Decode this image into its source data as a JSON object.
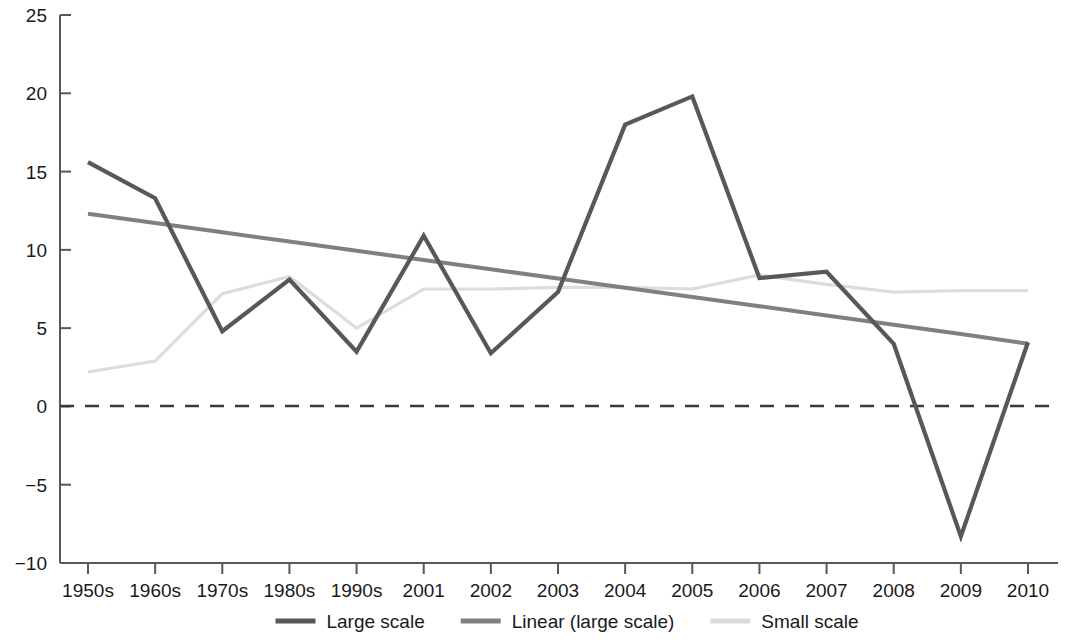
{
  "chart_data": {
    "type": "line",
    "title": "",
    "subtitle": "",
    "xlabel": "",
    "ylabel": "",
    "categories": [
      "1950s",
      "1960s",
      "1970s",
      "1980s",
      "1990s",
      "2001",
      "2002",
      "2003",
      "2004",
      "2005",
      "2006",
      "2007",
      "2008",
      "2009",
      "2010"
    ],
    "ylim": [
      -10,
      25
    ],
    "yticks": [
      25,
      20,
      15,
      10,
      5,
      0,
      -5,
      -10
    ],
    "ytick_labels": [
      "25",
      "20",
      "15",
      "10",
      "5",
      "0",
      "−5",
      "−10"
    ],
    "grid": false,
    "legend_position": "bottom",
    "zero_reference_line": true,
    "series": [
      {
        "name": "Large scale",
        "color": "#58585a",
        "width": 4.2,
        "values": [
          15.6,
          13.3,
          4.8,
          8.1,
          3.5,
          10.9,
          3.4,
          7.3,
          18.0,
          19.8,
          8.2,
          8.6,
          4.0,
          -8.3,
          4.1
        ]
      },
      {
        "name": "Linear (large scale)",
        "color": "#808083",
        "width": 4.0,
        "trend": true,
        "values": [
          12.3,
          11.71,
          11.12,
          10.53,
          9.94,
          9.35,
          8.76,
          8.17,
          7.58,
          6.99,
          6.4,
          5.81,
          5.22,
          4.63,
          4.0
        ]
      },
      {
        "name": "Small scale",
        "color": "#dcdcdc",
        "width": 3.2,
        "values": [
          2.2,
          2.9,
          7.2,
          8.3,
          5.0,
          7.5,
          7.5,
          7.6,
          7.6,
          7.5,
          8.4,
          7.8,
          7.3,
          7.4,
          7.4
        ]
      }
    ]
  },
  "legend": {
    "items": [
      {
        "label": "Large scale",
        "color": "#58585a"
      },
      {
        "label": "Linear (large scale)",
        "color": "#808083"
      },
      {
        "label": "Small scale",
        "color": "#dcdcdc"
      }
    ]
  },
  "axes": {
    "y_tick_labels": [
      "25",
      "20",
      "15",
      "10",
      "5",
      "0",
      "−5",
      "−10"
    ],
    "x_tick_labels": [
      "1950s",
      "1960s",
      "1970s",
      "1980s",
      "1990s",
      "2001",
      "2002",
      "2003",
      "2004",
      "2005",
      "2006",
      "2007",
      "2008",
      "2009",
      "2010"
    ]
  }
}
